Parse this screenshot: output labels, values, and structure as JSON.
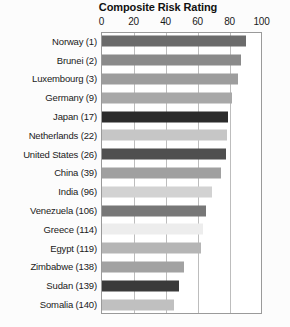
{
  "chart_data": {
    "type": "bar",
    "orientation": "horizontal",
    "title": "Composite Risk Rating",
    "xlabel": "",
    "ylabel": "",
    "xlim": [
      0,
      100
    ],
    "xticks": [
      0,
      20,
      40,
      60,
      80,
      100
    ],
    "grid": true,
    "legend": "none",
    "categories": [
      "Norway (1)",
      "Brunei (2)",
      "Luxembourg (3)",
      "Germany (9)",
      "Japan (17)",
      "Netherlands (22)",
      "United States (26)",
      "China (39)",
      "India (96)",
      "Venezuela (106)",
      "Greece (114)",
      "Egypt (119)",
      "Zimbabwe (138)",
      "Sudan (139)",
      "Somalia (140)"
    ],
    "values": [
      90,
      87,
      85,
      81,
      79,
      78,
      77.5,
      74.5,
      69,
      65,
      63,
      62,
      51,
      48,
      45
    ],
    "bar_colors": [
      "#6b6b6b",
      "#8a8a8a",
      "#9d9d9d",
      "#a8a8a8",
      "#2b2b2b",
      "#c6c6c6",
      "#4f4f4f",
      "#a0a0a0",
      "#d2d2d2",
      "#777777",
      "#ededed",
      "#b5b5b5",
      "#a2a2a2",
      "#3a3a3a",
      "#c0c0c0"
    ],
    "frame_color": "#9a9a9a",
    "gridline_color": "#bdbdbd",
    "background": "#ffffff"
  }
}
